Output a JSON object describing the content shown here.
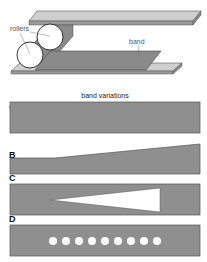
{
  "illustration": {
    "labels": {
      "rollers": "rollers",
      "band": "band"
    },
    "colors": {
      "plate": "#c8c8c8",
      "band": "#8a8a8a",
      "roller": "#ffffff",
      "outline": "#444444"
    }
  },
  "variations": {
    "title": "band variations",
    "panels": [
      {
        "letter": "A",
        "description": "uniform rectangular band"
      },
      {
        "letter": "B",
        "description": "band with tapering width"
      },
      {
        "letter": "C",
        "description": "band with triangular cut-out"
      },
      {
        "letter": "D",
        "description": "band with row of holes",
        "hole_count": 9
      }
    ],
    "colors": {
      "band_fill": "#8f8f8f",
      "band_stroke": "#555555",
      "cutout": "#ffffff"
    }
  }
}
